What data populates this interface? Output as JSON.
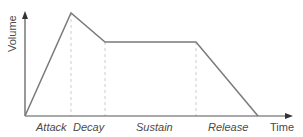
{
  "diagram": {
    "y_axis_label": "Volume",
    "x_axis_label": "Time",
    "phases": [
      {
        "label": "Attack"
      },
      {
        "label": "Decay"
      },
      {
        "label": "Sustain"
      },
      {
        "label": "Release"
      }
    ],
    "colors": {
      "envelope": "#7a7a7a",
      "axis": "#555555",
      "guide": "#cccccc",
      "text": "#4a4a4a"
    }
  }
}
